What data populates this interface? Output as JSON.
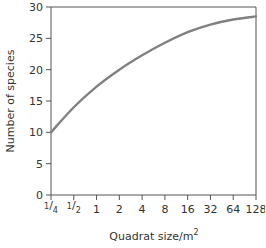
{
  "chart_data": {
    "type": "line",
    "title": "",
    "xlabel": "Quadrat size/m",
    "xlabel_superscript": "2",
    "ylabel": "Number of species",
    "x_scale": "log2",
    "categories": [
      "1/4",
      "1/2",
      "1",
      "2",
      "4",
      "8",
      "16",
      "32",
      "64",
      "128"
    ],
    "x": [
      0.25,
      0.5,
      1,
      2,
      4,
      8,
      16,
      32,
      64,
      128
    ],
    "series": [
      {
        "name": "Species-area curve",
        "values": [
          10,
          14,
          17.3,
          20,
          22.3,
          24.3,
          26,
          27.2,
          28,
          28.5
        ]
      }
    ],
    "yticks": [
      0,
      5,
      10,
      15,
      20,
      25,
      30
    ],
    "ylim": [
      0,
      30
    ],
    "grid": false,
    "legend": "none",
    "colors": {
      "line": "#808080",
      "axis": "#555555",
      "text": "#333333"
    }
  }
}
